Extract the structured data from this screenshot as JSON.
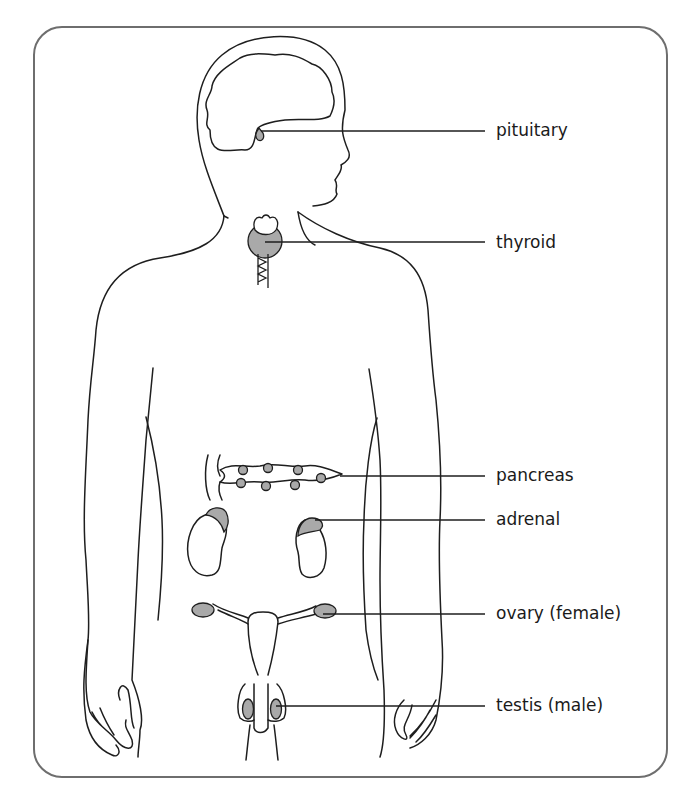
{
  "diagram": {
    "colors": {
      "frame": "#6e6e6e",
      "outline": "#1e1e1e",
      "gland_fill": "#a9a9a9",
      "background": "#ffffff"
    },
    "labels": [
      {
        "id": "pituitary",
        "text": "pituitary",
        "x": 496,
        "y": 120
      },
      {
        "id": "thyroid",
        "text": "thyroid",
        "x": 496,
        "y": 233
      },
      {
        "id": "pancreas",
        "text": "pancreas",
        "x": 496,
        "y": 465
      },
      {
        "id": "adrenal",
        "text": "adrenal",
        "x": 496,
        "y": 510
      },
      {
        "id": "ovary",
        "text": "ovary (female)",
        "x": 496,
        "y": 605
      },
      {
        "id": "testis",
        "text": "testis (male)",
        "x": 496,
        "y": 697
      }
    ]
  }
}
